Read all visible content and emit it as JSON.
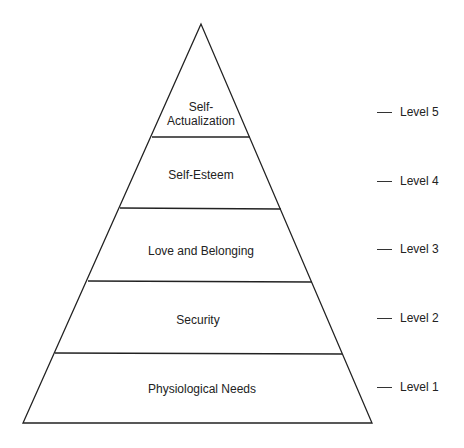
{
  "diagram": {
    "type": "pyramid",
    "stroke_color": "#222222",
    "background": "#ffffff",
    "tiers": [
      {
        "label_line1": "Self-",
        "label_line2": "Actualization",
        "level": "Level 5"
      },
      {
        "label_line1": "Self-Esteem",
        "level": "Level 4"
      },
      {
        "label_line1": "Love and Belonging",
        "level": "Level 3"
      },
      {
        "label_line1": "Security",
        "level": "Level 2"
      },
      {
        "label_line1": "Physiological Needs",
        "level": "Level 1"
      }
    ]
  }
}
